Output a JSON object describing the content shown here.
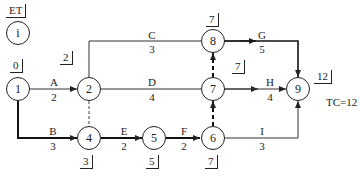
{
  "legend": {
    "et_label": "ET",
    "node_label": "i"
  },
  "total_duration": "TC=12",
  "nodes": [
    {
      "id": "1",
      "et": "0"
    },
    {
      "id": "2",
      "et": "2"
    },
    {
      "id": "3",
      "et": ""
    },
    {
      "id": "4",
      "et": "3"
    },
    {
      "id": "5",
      "et": "5"
    },
    {
      "id": "6",
      "et": "7"
    },
    {
      "id": "7",
      "et": "7"
    },
    {
      "id": "8",
      "et": "7"
    },
    {
      "id": "9",
      "et": "12"
    }
  ],
  "activities": [
    {
      "name": "A",
      "duration": "2",
      "from": "1",
      "to": "2",
      "critical": false
    },
    {
      "name": "B",
      "duration": "3",
      "from": "1",
      "to": "4",
      "critical": true
    },
    {
      "name": "C",
      "duration": "3",
      "from": "2",
      "to": "8",
      "critical": false
    },
    {
      "name": "D",
      "duration": "4",
      "from": "2",
      "to": "7",
      "critical": false
    },
    {
      "name": "E",
      "duration": "2",
      "from": "4",
      "to": "5",
      "critical": true
    },
    {
      "name": "F",
      "duration": "2",
      "from": "5",
      "to": "6",
      "critical": true
    },
    {
      "name": "G",
      "duration": "5",
      "from": "8",
      "to": "9",
      "critical": true
    },
    {
      "name": "H",
      "duration": "4",
      "from": "7",
      "to": "9",
      "critical": false
    },
    {
      "name": "I",
      "duration": "3",
      "from": "6",
      "to": "9",
      "critical": false
    }
  ],
  "dummies": [
    {
      "from": "2",
      "to": "4",
      "critical": false
    },
    {
      "from": "6",
      "to": "7",
      "critical": true
    },
    {
      "from": "7",
      "to": "8",
      "critical": true
    }
  ]
}
